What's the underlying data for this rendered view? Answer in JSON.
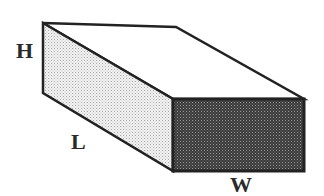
{
  "diagram": {
    "type": "rectangular-prism",
    "labels": {
      "height": "H",
      "length": "L",
      "width": "W"
    },
    "faces": {
      "top": {
        "fill": "#ffffff"
      },
      "side": {
        "fill": "#e4e4e4",
        "pattern": "light-stipple"
      },
      "front": {
        "fill": "#5a5a5a",
        "pattern": "dark-stipple"
      }
    },
    "stroke_color": "#222222"
  }
}
